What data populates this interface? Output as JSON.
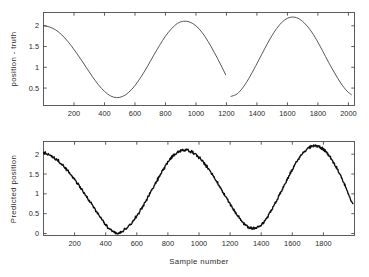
{
  "figure": {
    "background": "#ffffff",
    "line_color_top": "#3a3a3a",
    "line_color_bottom": "#0d0d0d",
    "axis_color": "#4a4a4a"
  },
  "chart_data": [
    {
      "id": "top",
      "type": "line",
      "title": "",
      "xlabel": "",
      "ylabel": "position - truth",
      "xlim": [
        0,
        2040
      ],
      "ylim": [
        0.08,
        2.32
      ],
      "grid": false,
      "legend": "none",
      "xticks": [
        200,
        400,
        600,
        800,
        1000,
        1200,
        1400,
        1600,
        1800,
        2000
      ],
      "xticklabels": [
        "200",
        "400",
        "600",
        "800",
        "1000",
        "1200",
        "1400",
        "1600",
        "1800",
        "2000"
      ],
      "yticks": [
        0.5,
        1,
        1.5,
        2
      ],
      "yticklabels": [
        "0.5",
        "1",
        "1.5",
        "2"
      ],
      "series": [
        {
          "name": "position - truth",
          "note": "smooth sinusoid, period 800 samples, minima at 400 and 1200, maxima at 800 and 1600; small discontinuity (gap) at the minimum near sample 1200",
          "x": [
            0,
            40,
            80,
            120,
            160,
            200,
            240,
            280,
            320,
            360,
            400,
            440,
            480,
            520,
            560,
            600,
            640,
            680,
            720,
            760,
            800,
            840,
            880,
            920,
            960,
            1000,
            1040,
            1080,
            1120,
            1160,
            1195
          ],
          "y": [
            2.0,
            1.97,
            1.9,
            1.78,
            1.62,
            1.43,
            1.22,
            1.0,
            0.78,
            0.58,
            0.42,
            0.31,
            0.27,
            0.3,
            0.4,
            0.56,
            0.77,
            1.01,
            1.27,
            1.52,
            1.75,
            1.93,
            2.06,
            2.11,
            2.09,
            2.0,
            1.84,
            1.62,
            1.36,
            1.08,
            0.82
          ],
          "x2": [
            1230,
            1270,
            1310,
            1350,
            1390,
            1430,
            1470,
            1510,
            1550,
            1590,
            1630,
            1670,
            1710,
            1750,
            1790,
            1830,
            1870,
            1910,
            1950,
            1990,
            2020
          ],
          "y2": [
            0.3,
            0.36,
            0.52,
            0.75,
            1.02,
            1.3,
            1.58,
            1.83,
            2.03,
            2.16,
            2.21,
            2.18,
            2.07,
            1.9,
            1.67,
            1.4,
            1.12,
            0.86,
            0.62,
            0.43,
            0.34
          ]
        }
      ]
    },
    {
      "id": "bottom",
      "type": "line",
      "title": "",
      "xlabel": "Sample number",
      "ylabel": "Predicted position",
      "xlim": [
        0,
        2000
      ],
      "ylim": [
        -0.05,
        2.32
      ],
      "grid": false,
      "legend": "none",
      "xticks": [
        200,
        400,
        600,
        800,
        1000,
        1200,
        1400,
        1600,
        1800
      ],
      "xticklabels": [
        "200",
        "400",
        "600",
        "800",
        "1000",
        "1200",
        "1400",
        "1600",
        "1800"
      ],
      "yticks": [
        0,
        0.5,
        1,
        1.5,
        2
      ],
      "yticklabels": [
        "0",
        "0.5",
        "1",
        "1.5",
        "2"
      ],
      "series": [
        {
          "name": "Predicted position",
          "note": "noisy sinusoid, period 800 samples, minima near 400 (value 0.0) and 1200 (value 0.13), maxima near 800 (2.10) and 1600 (2.20), start 2.05, end 0.27",
          "x": [
            0,
            40,
            80,
            120,
            160,
            200,
            240,
            280,
            320,
            360,
            400,
            440,
            480,
            520,
            560,
            600,
            640,
            680,
            720,
            760,
            800,
            840,
            880,
            920,
            960,
            1000,
            1040,
            1080,
            1120,
            1160,
            1200,
            1240,
            1280,
            1320,
            1360,
            1400,
            1440,
            1480,
            1520,
            1560,
            1600,
            1640,
            1680,
            1720,
            1760,
            1800,
            1840,
            1880,
            1920,
            1960,
            1990
          ],
          "y": [
            2.05,
            1.98,
            1.88,
            1.74,
            1.56,
            1.36,
            1.14,
            0.91,
            0.68,
            0.44,
            0.22,
            0.06,
            0.02,
            0.09,
            0.24,
            0.45,
            0.7,
            0.98,
            1.26,
            1.54,
            1.8,
            1.98,
            2.08,
            2.1,
            2.04,
            1.92,
            1.74,
            1.52,
            1.27,
            1.0,
            0.74,
            0.5,
            0.3,
            0.16,
            0.14,
            0.22,
            0.42,
            0.69,
            0.99,
            1.31,
            1.62,
            1.88,
            2.08,
            2.19,
            2.2,
            2.12,
            1.95,
            1.7,
            1.38,
            1.02,
            0.72
          ]
        }
      ]
    }
  ]
}
